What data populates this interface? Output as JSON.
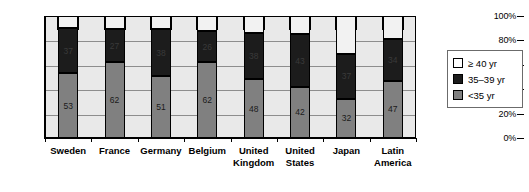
{
  "chart_data": {
    "type": "bar",
    "subtype": "stacked-percent",
    "title": "",
    "xlabel": "",
    "ylabel": "",
    "ylim": [
      0,
      100
    ],
    "ytick_labels": [
      "0%",
      "20%",
      "40%",
      "60%",
      "80%",
      "100%"
    ],
    "ytick_values": [
      0,
      20,
      40,
      60,
      80,
      100
    ],
    "grid": true,
    "legend_position": "right",
    "categories": [
      "Sweden",
      "France",
      "Germany",
      "Belgium",
      "United Kingdom",
      "United States",
      "Japan",
      "Latin America"
    ],
    "series": [
      {
        "name": "<35 yr",
        "color": "#808080",
        "values": [
          53,
          62,
          51,
          62,
          48,
          42,
          32,
          47
        ]
      },
      {
        "name": "35–39 yr",
        "color": "#1c1c1c",
        "values": [
          37,
          27,
          38,
          26,
          38,
          43,
          37,
          34
        ]
      },
      {
        "name": "≥ 40 yr",
        "color": "#ffffff",
        "values": [
          10,
          11,
          11,
          12,
          14,
          15,
          31,
          19
        ]
      }
    ]
  },
  "legend": {
    "items": [
      {
        "label": "≥ 40 yr",
        "swatch": "white-swatch"
      },
      {
        "label": "35–39 yr",
        "swatch": "black-swatch"
      },
      {
        "label": "<35 yr",
        "swatch": "gray-swatch"
      }
    ]
  }
}
